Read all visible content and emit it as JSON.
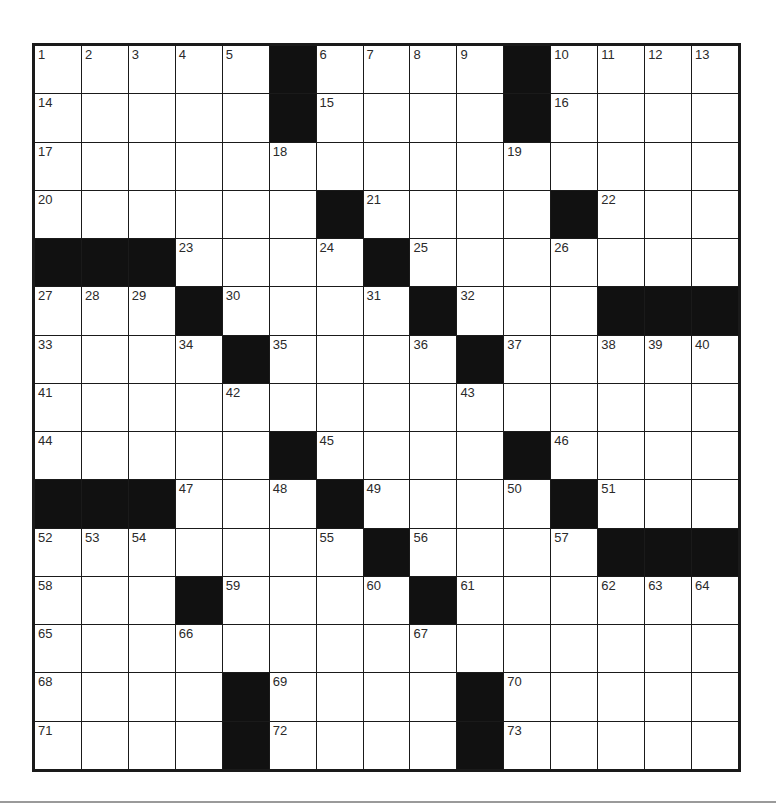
{
  "puzzle": {
    "rows": 15,
    "cols": 15,
    "colors": {
      "block": "#111111",
      "cell": "#ffffff",
      "border": "#1a1a1a",
      "number": "#2a2a2a",
      "footer_rule": "#9a9a9a"
    },
    "grid": [
      [
        "1",
        "2",
        "3",
        "4",
        "5",
        "#",
        "6",
        "7",
        "8",
        "9",
        "#",
        "10",
        "11",
        "12",
        "13"
      ],
      [
        "14",
        "",
        "",
        "",
        "",
        "#",
        "15",
        "",
        "",
        "",
        "#",
        "16",
        "",
        "",
        ""
      ],
      [
        "17",
        "",
        "",
        "",
        "",
        "18",
        "",
        "",
        "",
        "",
        "19",
        "",
        "",
        "",
        ""
      ],
      [
        "20",
        "",
        "",
        "",
        "",
        "",
        "#",
        "21",
        "",
        "",
        "",
        "#",
        "22",
        "",
        ""
      ],
      [
        "#",
        "#",
        "#",
        "23",
        "",
        "",
        "24",
        "#",
        "25",
        "",
        "",
        "26",
        "",
        "",
        ""
      ],
      [
        "27",
        "28",
        "29",
        "#",
        "30",
        "",
        "",
        "31",
        "#",
        "32",
        "",
        "",
        "#",
        "#",
        "#"
      ],
      [
        "33",
        "",
        "",
        "34",
        "#",
        "35",
        "",
        "",
        "36",
        "#",
        "37",
        "",
        "38",
        "39",
        "40"
      ],
      [
        "41",
        "",
        "",
        "",
        "42",
        "",
        "",
        "",
        "",
        "43",
        "",
        "",
        "",
        "",
        ""
      ],
      [
        "44",
        "",
        "",
        "",
        "",
        "#",
        "45",
        "",
        "",
        "",
        "#",
        "46",
        "",
        "",
        ""
      ],
      [
        "#",
        "#",
        "#",
        "47",
        "",
        "48",
        "#",
        "49",
        "",
        "",
        "50",
        "#",
        "51",
        "",
        ""
      ],
      [
        "52",
        "53",
        "54",
        "",
        "",
        "",
        "55",
        "#",
        "56",
        "",
        "",
        "57",
        "#",
        "#",
        "#"
      ],
      [
        "58",
        "",
        "",
        "#",
        "59",
        "",
        "",
        "60",
        "#",
        "61",
        "",
        "",
        "62",
        "63",
        "64"
      ],
      [
        "65",
        "",
        "",
        "66",
        "",
        "",
        "",
        "",
        "67",
        "",
        "",
        "",
        "",
        "",
        ""
      ],
      [
        "68",
        "",
        "",
        "",
        "#",
        "69",
        "",
        "",
        "",
        "#",
        "70",
        "",
        "",
        "",
        ""
      ],
      [
        "71",
        "",
        "",
        "",
        "#",
        "72",
        "",
        "",
        "",
        "#",
        "73",
        "",
        "",
        "",
        ""
      ]
    ]
  }
}
